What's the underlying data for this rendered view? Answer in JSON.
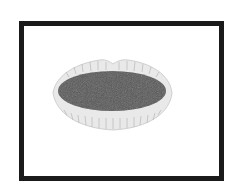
{
  "image": {
    "subject": "open mouth / lips illustration",
    "frame_color": "#1a1a1a",
    "background": "#ffffff",
    "lip_color": "#e6e6e6",
    "lip_line_color": "#b0b0b0",
    "mouth_interior_color": "#555555"
  }
}
